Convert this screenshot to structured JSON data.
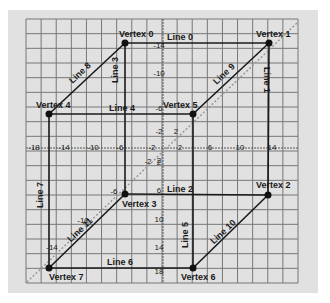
{
  "diagram": {
    "type": "wireframe-cube-on-grid",
    "colors": {
      "background": "#ffffff",
      "panel": "#e1e1e1",
      "grid": "#777777",
      "edge": "#1a1a1a",
      "vertex": "#111111",
      "diagonal_axis": "#999999"
    },
    "vertices": [
      {
        "id": 0,
        "label": "Vertex 0",
        "x": 125,
        "y": 43,
        "lx": 119,
        "ly": 37,
        "anchor": "start"
      },
      {
        "id": 1,
        "label": "Vertex 1",
        "x": 269,
        "y": 43,
        "lx": 256,
        "ly": 37,
        "anchor": "start"
      },
      {
        "id": 2,
        "label": "Vertex 2",
        "x": 268,
        "y": 195,
        "lx": 256,
        "ly": 188,
        "anchor": "start"
      },
      {
        "id": 3,
        "label": "Vertex 3",
        "x": 125,
        "y": 194,
        "lx": 122,
        "ly": 207,
        "anchor": "start"
      },
      {
        "id": 4,
        "label": "Vertex 4",
        "x": 49,
        "y": 114,
        "lx": 36,
        "ly": 108,
        "anchor": "start"
      },
      {
        "id": 5,
        "label": "Vertex 5",
        "x": 193,
        "y": 114,
        "lx": 163,
        "ly": 108,
        "anchor": "start"
      },
      {
        "id": 6,
        "label": "Vertex 6",
        "x": 193,
        "y": 268,
        "lx": 181,
        "ly": 280,
        "anchor": "start"
      },
      {
        "id": 7,
        "label": "Vertex 7",
        "x": 49,
        "y": 268,
        "lx": 49,
        "ly": 280,
        "anchor": "start"
      }
    ],
    "edges": [
      {
        "label": "Line 0",
        "from": 0,
        "to": 1,
        "lx": 180,
        "ly": 40,
        "rot": 0
      },
      {
        "label": "Line 1",
        "from": 1,
        "to": 2,
        "lx": 264,
        "ly": 80,
        "rot": 90
      },
      {
        "label": "Line 2",
        "from": 3,
        "to": 2,
        "lx": 180,
        "ly": 192,
        "rot": 0
      },
      {
        "label": "Line 3",
        "from": 0,
        "to": 3,
        "lx": 118,
        "ly": 70,
        "rot": -90
      },
      {
        "label": "Line 4",
        "from": 4,
        "to": 5,
        "lx": 122,
        "ly": 111,
        "rot": 0
      },
      {
        "label": "Line 5",
        "from": 5,
        "to": 6,
        "lx": 188,
        "ly": 235,
        "rot": -90
      },
      {
        "label": "Line 6",
        "from": 7,
        "to": 6,
        "lx": 120,
        "ly": 265,
        "rot": 0
      },
      {
        "label": "Line 7",
        "from": 4,
        "to": 7,
        "lx": 43,
        "ly": 195,
        "rot": -90
      },
      {
        "label": "Line 8",
        "from": 4,
        "to": 0,
        "lx": 82,
        "ly": 75,
        "rot": -43
      },
      {
        "label": "Line 9",
        "from": 5,
        "to": 1,
        "lx": 226,
        "ly": 76,
        "rot": -43
      },
      {
        "label": "Line 10",
        "from": 6,
        "to": 2,
        "lx": 225,
        "ly": 234,
        "rot": -43
      },
      {
        "label": "Line 11",
        "from": 7,
        "to": 3,
        "lx": 82,
        "ly": 232,
        "rot": -43
      }
    ],
    "grid": {
      "x0": 26,
      "y0": 19,
      "x1": 298,
      "y1": 283,
      "cols": 18,
      "rows": 18
    },
    "axes": {
      "x_axis_y": 148,
      "y_axis_x": 163,
      "x_ticks": [
        {
          "label": "-18",
          "x": 34,
          "y": 150
        },
        {
          "label": "-14",
          "x": 64,
          "y": 150
        },
        {
          "label": "-10",
          "x": 93,
          "y": 150
        },
        {
          "label": "-6",
          "x": 120,
          "y": 150
        },
        {
          "label": "-2",
          "x": 152,
          "y": 150
        },
        {
          "label": "2",
          "x": 180,
          "y": 150
        },
        {
          "label": "6",
          "x": 210,
          "y": 150
        },
        {
          "label": "10",
          "x": 240,
          "y": 150
        },
        {
          "label": "14",
          "x": 272,
          "y": 150
        }
      ],
      "y_ticks": [
        {
          "label": "-14",
          "x": 159,
          "y": 48
        },
        {
          "label": "-10",
          "x": 159,
          "y": 76
        },
        {
          "label": "-6",
          "x": 159,
          "y": 111
        },
        {
          "label": "-2",
          "x": 159,
          "y": 134
        },
        {
          "label": "2",
          "x": 159,
          "y": 165
        },
        {
          "label": "6",
          "x": 159,
          "y": 193
        },
        {
          "label": "10",
          "x": 159,
          "y": 222
        },
        {
          "label": "14",
          "x": 159,
          "y": 250
        },
        {
          "label": "18",
          "x": 159,
          "y": 274
        }
      ],
      "diag_ticks": [
        {
          "label": "2",
          "x": 176,
          "y": 134
        },
        {
          "label": "-2",
          "x": 148,
          "y": 164
        },
        {
          "label": "2",
          "x": 159,
          "y": 163
        },
        {
          "label": "-6",
          "x": 114,
          "y": 194
        },
        {
          "label": "-10",
          "x": 83,
          "y": 223
        },
        {
          "label": "-14",
          "x": 52,
          "y": 250
        }
      ],
      "diagonal": {
        "x1": 27,
        "y1": 282,
        "x2": 298,
        "y2": 22
      }
    }
  }
}
